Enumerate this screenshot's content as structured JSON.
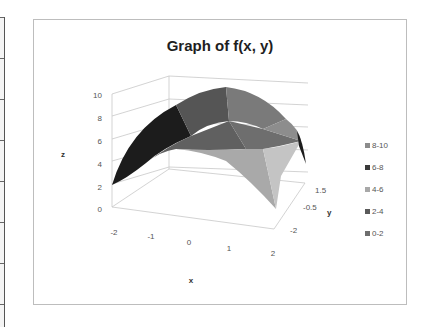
{
  "spreadsheet_edge": {
    "row_lines_y": [
      17,
      58,
      99,
      140,
      181,
      222,
      263,
      304
    ]
  },
  "chart_data": {
    "type": "surface",
    "title": "Graph of f(x, y)",
    "xlabel": "x",
    "ylabel": "y",
    "zlabel": "z",
    "x_ticks": [
      "-2",
      "-1",
      "0",
      "1",
      "2"
    ],
    "y_ticks": [
      "-2",
      "-0.5",
      "1.5"
    ],
    "z_ticks": [
      "0",
      "2",
      "4",
      "6",
      "8",
      "10"
    ],
    "zlim": [
      0,
      10
    ],
    "x_range": [
      -2,
      2
    ],
    "y_range": [
      -2,
      2
    ],
    "surface_description": "Concave-down paraboloid peaking near z≈10 at (0,0), falling to z≈2 at the x/y corners",
    "legend": [
      {
        "label": "8-10",
        "color": "#8c8c8c"
      },
      {
        "label": "6-8",
        "color": "#3a3a3a"
      },
      {
        "label": "4-6",
        "color": "#a8a8a8"
      },
      {
        "label": "2-4",
        "color": "#5a5a5a"
      },
      {
        "label": "0-2",
        "color": "#6e6e6e"
      }
    ],
    "legend_position": "right",
    "grid": true
  }
}
